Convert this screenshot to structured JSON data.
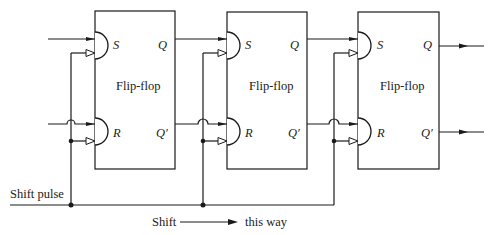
{
  "diagram": {
    "type": "shift-register-logic-diagram",
    "flip_flops": [
      {
        "label": "Flip-flop",
        "set_label": "S",
        "reset_label": "R",
        "q_label": "Q",
        "q_bar_label": "Q′"
      },
      {
        "label": "Flip-flop",
        "set_label": "S",
        "reset_label": "R",
        "q_label": "Q",
        "q_bar_label": "Q′"
      },
      {
        "label": "Flip-flop",
        "set_label": "S",
        "reset_label": "R",
        "q_label": "Q",
        "q_bar_label": "Q′"
      }
    ],
    "shift_pulse_label": "Shift pulse",
    "direction": {
      "left_label": "Shift",
      "right_label": "this way"
    },
    "colors": {
      "line": "#1a1a1a",
      "background": "#ffffff"
    }
  }
}
